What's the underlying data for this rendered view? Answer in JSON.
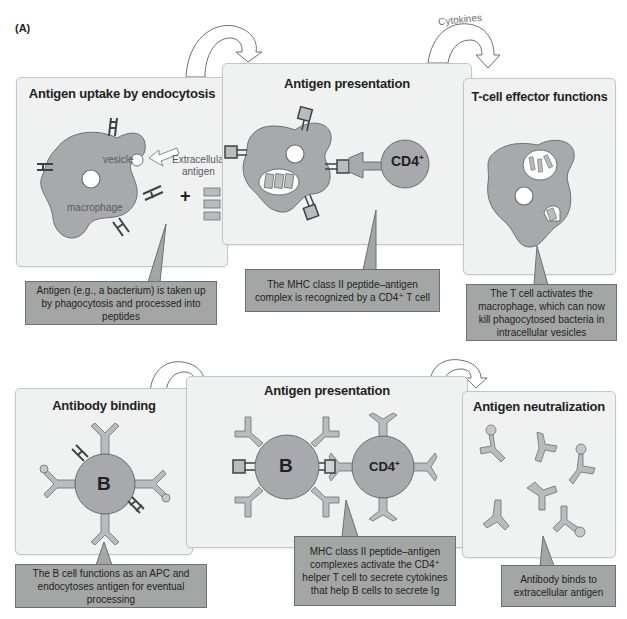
{
  "figure": {
    "label": "(A)",
    "arrow_label": "Cytokines"
  },
  "top_row": {
    "panels": [
      {
        "title": "Antigen uptake by endocytosis",
        "labels": {
          "vesicle": "vesicle",
          "extracellular_antigen_1": "Extracellular",
          "extracellular_antigen_2": "antigen",
          "macrophage": "macrophage",
          "plus": "+"
        },
        "callout": "Antigen (e.g., a bacterium) is taken up by phagocytosis and processed into peptides"
      },
      {
        "title": "Antigen presentation",
        "labels": {
          "cd4": "CD4",
          "cd4_sup": "+"
        },
        "callout": "The MHC class II peptide–antigen complex is recognized by a CD4⁺ T cell"
      },
      {
        "title": "T-cell effector functions",
        "callout": "The T cell activates the macrophage, which can now kill phagocytosed bacteria in intracellular vesicles"
      }
    ]
  },
  "bottom_row": {
    "panels": [
      {
        "title": "Antibody binding",
        "labels": {
          "b_cell": "B"
        },
        "callout": "The B cell functions as an APC and endocytoses antigen for eventual processing"
      },
      {
        "title": "Antigen presentation",
        "labels": {
          "b_cell": "B",
          "cd4": "CD4",
          "cd4_sup": "+"
        },
        "callout": "MHC class II peptide–antigen complexes activate the CD4⁺ helper T cell to secrete cytokines that help B cells to secrete Ig"
      },
      {
        "title": "Antigen neutralization",
        "callout": "Antibody binds to extracellular antigen"
      }
    ]
  },
  "colors": {
    "panel_bg": "#f0f1f1",
    "cell_fill": "#a7a9ac",
    "callout_bg": "#a4a6a6",
    "outline": "#6d6f70",
    "text": "#231f20"
  }
}
